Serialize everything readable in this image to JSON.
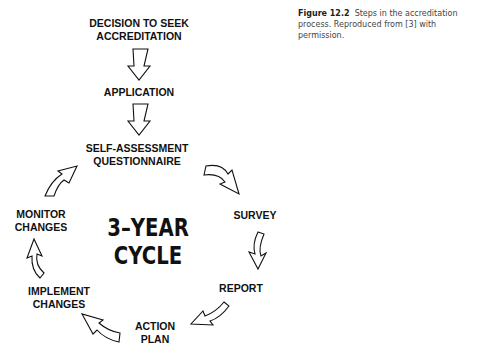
{
  "figure": {
    "caption": {
      "label": "Figure 12.2",
      "text": "Steps in the accreditation process. Reproduced from [3] with permission."
    },
    "center_label": "3–YEAR\nCYCLE",
    "steps": {
      "decision": "DECISION TO SEEK\nACCREDITATION",
      "application": "APPLICATION",
      "questionnaire": "SELF-ASSESSMENT\nQUESTIONNAIRE",
      "survey": "SURVEY",
      "report": "REPORT",
      "action_plan": "ACTION\nPLAN",
      "implement": "IMPLEMENT\nCHANGES",
      "monitor": "MONITOR\nCHANGES"
    },
    "arrows": [
      "down-arrow decision→application",
      "down-arrow application→questionnaire",
      "curved-arrow questionnaire→survey",
      "curved-arrow survey→report",
      "curved-arrow report→action plan",
      "curved-arrow action plan→implement",
      "curved-arrow implement→monitor",
      "curved-arrow monitor→questionnaire"
    ]
  }
}
